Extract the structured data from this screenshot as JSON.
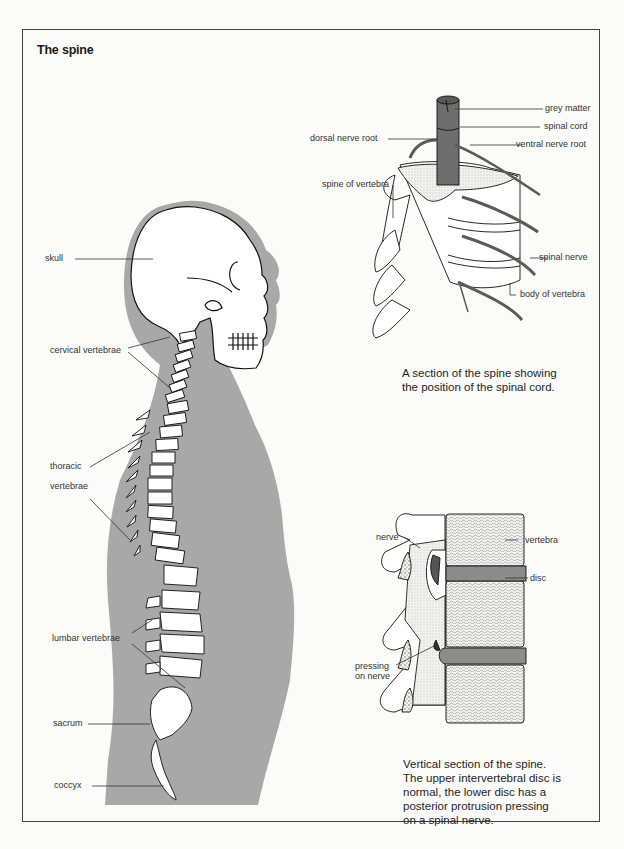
{
  "title": "The spine",
  "figure_body": {
    "labels": {
      "skull": "skull",
      "cervical": "cervical vertebrae",
      "thoracic_1": "thoracic",
      "thoracic_2": "vertebrae",
      "lumbar": "lumbar vertebrae",
      "sacrum": "sacrum",
      "coccyx": "coccyx"
    },
    "silhouette_color": "#a8a8a8"
  },
  "figure_section": {
    "labels": {
      "grey_matter": "grey matter",
      "spinal_cord": "spinal cord",
      "dorsal_root": "dorsal nerve root",
      "ventral_root": "ventral nerve root",
      "spine_of_vertebra": "spine of vertebra",
      "spinal_nerve": "spinal nerve",
      "body_of_vertebra": "body of vertebra"
    },
    "caption": {
      "line1": "A section of the spine showing",
      "line2": "the position of the spinal cord."
    },
    "cord_color": "#6e6e6e"
  },
  "figure_vertical": {
    "labels": {
      "nerve": "nerve",
      "vertebra": "vertebra",
      "disc": "disc",
      "pressing_1": "pressing",
      "pressing_2": "on nerve"
    },
    "caption": {
      "line1": "Vertical section of the spine.",
      "line2": "The upper intervertebral disc is",
      "line3": "normal, the lower disc has a",
      "line4": "posterior protrusion pressing",
      "line5": "on a spinal nerve."
    },
    "disc_color": "#8c8c8c"
  }
}
